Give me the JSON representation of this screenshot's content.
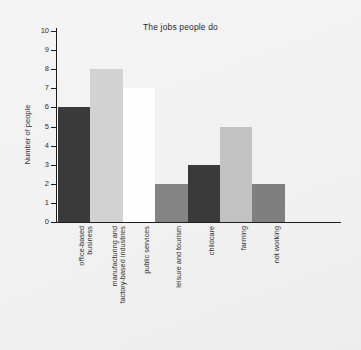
{
  "chart_data": {
    "type": "bar",
    "title": "The jobs people do",
    "xlabel": "",
    "ylabel": "Number of people",
    "ylim": [
      0,
      10
    ],
    "grid": false,
    "legend": null,
    "categories": [
      "office-based business",
      "manufacturing and factory-based industries",
      "public services",
      "leisure and tourism",
      "childcare",
      "farming",
      "not working"
    ],
    "category_lines": [
      [
        "office-based",
        "business"
      ],
      [
        "manufacturing and",
        "factory-based industries"
      ],
      [
        "public services",
        ""
      ],
      [
        "leisure and tourism",
        ""
      ],
      [
        "childcare",
        ""
      ],
      [
        "farming",
        ""
      ],
      [
        "not working",
        ""
      ]
    ],
    "values": [
      6,
      8,
      7,
      2,
      3,
      5,
      2
    ],
    "bar_colors": [
      "#3a3a3a",
      "#d2d2d2",
      "#fefefe",
      "#848484",
      "#3a3a3a",
      "#c2c2c2",
      "#7f7f7f"
    ],
    "ytick_labels": [
      "0",
      "1",
      "2",
      "3",
      "4",
      "5",
      "6",
      "7",
      "8",
      "9",
      "10"
    ],
    "ytick_values": [
      0,
      1,
      2,
      3,
      4,
      5,
      6,
      7,
      8,
      9,
      10
    ]
  },
  "colors": {
    "background": "#f2f2f2",
    "axis": "#1d1d1d",
    "text": "#2d2d2d"
  }
}
